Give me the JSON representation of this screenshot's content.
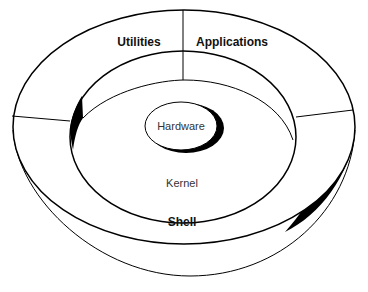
{
  "diagram": {
    "layers": {
      "hardware": "Hardware",
      "kernel": "Kernel",
      "shell": "Shell",
      "utilities": "Utilities",
      "applications": "Applications"
    },
    "colors": {
      "stroke": "#000000",
      "shadow": "#000000",
      "background": "#ffffff"
    }
  }
}
